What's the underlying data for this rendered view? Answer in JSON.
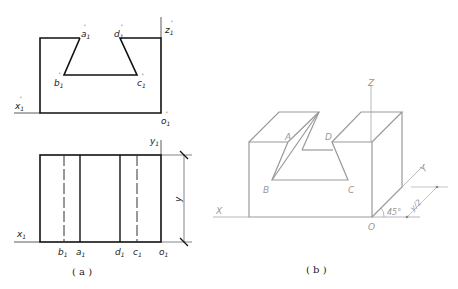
{
  "figure_a": {
    "caption": "( a )",
    "front_view": {
      "labels": {
        "a": "a",
        "b": "b",
        "c": "c",
        "d": "d",
        "o": "o",
        "x": "x",
        "z": "z",
        "sub": "1",
        "prime": "'"
      }
    },
    "top_view": {
      "labels": {
        "a": "a",
        "b": "b",
        "c": "c",
        "d": "d",
        "o": "o",
        "x": "x",
        "y": "y",
        "sub": "1",
        "dimension": "y"
      }
    }
  },
  "figure_b": {
    "caption": "( b )",
    "labels": {
      "A": "A",
      "B": "B",
      "C": "C",
      "D": "D",
      "O": "O",
      "X": "X",
      "Y": "Y",
      "Z": "Z",
      "angle": "45°",
      "dimension": "y/2"
    },
    "line_color": "#9a9a9a"
  }
}
